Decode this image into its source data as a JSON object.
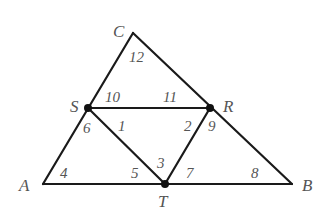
{
  "diagram": {
    "type": "geometry-triangle",
    "vertices": {
      "A": {
        "label": "A",
        "x": 43,
        "y": 184
      },
      "B": {
        "label": "B",
        "x": 292,
        "y": 184
      },
      "C": {
        "label": "C",
        "x": 133,
        "y": 33
      },
      "S": {
        "label": "S",
        "x": 88,
        "y": 108
      },
      "R": {
        "label": "R",
        "x": 210,
        "y": 108
      },
      "T": {
        "label": "T",
        "x": 165,
        "y": 184
      }
    },
    "segments": [
      [
        "A",
        "B"
      ],
      [
        "A",
        "C"
      ],
      [
        "C",
        "B"
      ],
      [
        "S",
        "R"
      ],
      [
        "S",
        "T"
      ],
      [
        "R",
        "T"
      ]
    ],
    "marked_points": [
      "S",
      "R",
      "T"
    ],
    "angles": [
      {
        "label": "1",
        "x": 118,
        "y": 131
      },
      {
        "label": "2",
        "x": 184,
        "y": 131
      },
      {
        "label": "3",
        "x": 157,
        "y": 168
      },
      {
        "label": "4",
        "x": 60,
        "y": 178
      },
      {
        "label": "5",
        "x": 131,
        "y": 178
      },
      {
        "label": "6",
        "x": 83,
        "y": 133
      },
      {
        "label": "7",
        "x": 186,
        "y": 178
      },
      {
        "label": "8",
        "x": 251,
        "y": 178
      },
      {
        "label": "9",
        "x": 208,
        "y": 131
      },
      {
        "label": "10",
        "x": 105,
        "y": 102
      },
      {
        "label": "11",
        "x": 163,
        "y": 102
      },
      {
        "label": "12",
        "x": 129,
        "y": 62
      }
    ],
    "colors": {
      "line": "#1a1a1a",
      "label": "#555555",
      "background": "#ffffff"
    }
  }
}
